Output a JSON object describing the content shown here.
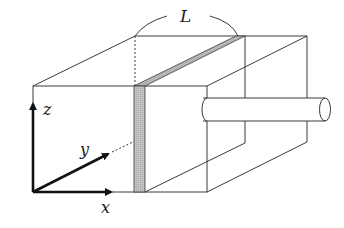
{
  "diagram": {
    "labels": {
      "length": "L",
      "axis_x": "x",
      "axis_y": "y",
      "axis_z": "z"
    },
    "colors": {
      "line": "#3a3a3a",
      "slab_fill": "#bdbdbd",
      "axis": "#111111",
      "background": "#ffffff"
    },
    "components": [
      "rectangular box (wireframe)",
      "thin shaded slab (plane at fixed x)",
      "cylindrical rod protruding from right face",
      "dimension arc labeled L",
      "coordinate axes x, y, z"
    ]
  }
}
